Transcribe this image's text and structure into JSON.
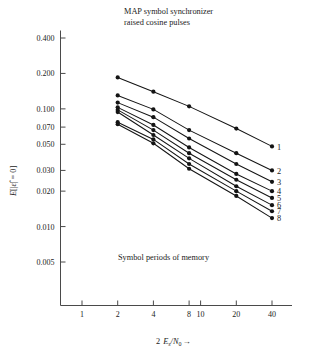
{
  "figure": {
    "title_line1": "MAP symbol synchronizer",
    "title_line2": "raised cosine pulses",
    "inner_note": "Symbol periods of memory",
    "ylabel_parts": {
      "e": "E",
      "open": "[|",
      "eps": "ε̂",
      "mid": "| = 0]"
    },
    "xlabel_parts": {
      "two": "2",
      "es": "E",
      "s": "s",
      "slash": "/N",
      "zero": "0",
      "arrow": "→"
    },
    "axis_color": "#4a4a4a",
    "marker_color": "#141414",
    "line_color": "#141414",
    "background": "#ffffff"
  },
  "chart_data": {
    "type": "line",
    "xlabel": "2 Es/N0",
    "ylabel": "E[|ε̂| = 0]",
    "xscale": "log",
    "yscale": "log",
    "xlim": [
      1,
      48
    ],
    "ylim": [
      0.0035,
      0.55
    ],
    "grid": false,
    "legend_position": "right-inline-labels",
    "xticks": [
      1,
      2,
      4,
      8,
      10,
      20,
      40
    ],
    "xticklabels": [
      "1",
      "2",
      "4",
      "8",
      "10",
      "20",
      "40"
    ],
    "yticks": [
      0.005,
      0.01,
      0.02,
      0.03,
      0.05,
      0.07,
      0.1,
      0.2,
      0.4
    ],
    "yticklabels": [
      "0.005",
      "0.010",
      "0.020",
      "0.030",
      "0.050",
      "0.070",
      "0.100",
      "0.200",
      "0.400"
    ],
    "x": [
      2,
      4,
      8,
      20,
      40
    ],
    "series": [
      {
        "name": "1",
        "label": "1",
        "values": [
          0.185,
          0.14,
          0.105,
          0.068,
          0.048
        ]
      },
      {
        "name": "2",
        "label": "2",
        "values": [
          0.13,
          0.099,
          0.066,
          0.042,
          0.03
        ]
      },
      {
        "name": "3",
        "label": "3",
        "values": [
          0.113,
          0.085,
          0.056,
          0.034,
          0.024
        ]
      },
      {
        "name": "4",
        "label": "4",
        "values": [
          0.103,
          0.073,
          0.047,
          0.028,
          0.02
        ]
      },
      {
        "name": "5",
        "label": "5",
        "values": [
          0.098,
          0.066,
          0.042,
          0.025,
          0.0175
        ]
      },
      {
        "name": "6",
        "label": "6",
        "values": [
          0.094,
          0.06,
          0.038,
          0.022,
          0.0152
        ]
      },
      {
        "name": "7",
        "label": "7",
        "values": [
          0.077,
          0.055,
          0.034,
          0.02,
          0.0135
        ]
      },
      {
        "name": "8",
        "label": "8",
        "values": [
          0.074,
          0.051,
          0.031,
          0.0182,
          0.0118
        ]
      }
    ]
  }
}
